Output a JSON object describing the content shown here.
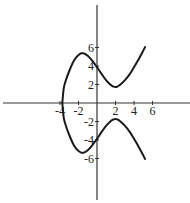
{
  "chart_data": {
    "type": "line",
    "title": "",
    "xlabel": "",
    "ylabel": "",
    "equation_approx": "y^2 = x^3 - 10x + 15",
    "xlim": [
      -10,
      10
    ],
    "ylim": [
      -10,
      10.5
    ],
    "grid": false,
    "legend": null,
    "x_ticks": [
      -4,
      -2,
      2,
      4,
      6
    ],
    "x_tick_labels": [
      "-4",
      "-2",
      "2",
      "4",
      "6"
    ],
    "y_ticks": [
      6,
      4,
      2,
      -2,
      -4,
      -6
    ],
    "y_tick_labels": [
      "6",
      "4",
      "2",
      "-2",
      "-4",
      "-6"
    ],
    "series": [
      {
        "name": "upper branch",
        "x": [
          -3.75,
          -3.6,
          -3.4,
          -3.0,
          -2.5,
          -2.0,
          -1.5,
          -1.0,
          -0.5,
          0,
          0.5,
          1.0,
          1.5,
          1.8,
          2.0,
          2.2,
          2.5,
          3.0,
          3.5,
          4.0,
          4.5,
          5.0,
          5.2
        ],
        "values": [
          0,
          1.56,
          2.35,
          3.46,
          4.57,
          5.2,
          5.39,
          5.1,
          4.55,
          3.87,
          3.13,
          2.45,
          1.94,
          1.77,
          1.73,
          1.78,
          1.98,
          2.45,
          3.07,
          3.87,
          4.72,
          5.66,
          6.05
        ]
      },
      {
        "name": "lower branch",
        "x": [
          -3.75,
          -3.6,
          -3.4,
          -3.0,
          -2.5,
          -2.0,
          -1.5,
          -1.0,
          -0.5,
          0,
          0.5,
          1.0,
          1.5,
          1.8,
          2.0,
          2.2,
          2.5,
          3.0,
          3.5,
          4.0,
          4.5,
          5.0,
          5.2
        ],
        "values": [
          0,
          -1.56,
          -2.35,
          -3.46,
          -4.57,
          -5.2,
          -5.39,
          -5.1,
          -4.55,
          -3.87,
          -3.13,
          -2.45,
          -1.94,
          -1.77,
          -1.73,
          -1.78,
          -1.98,
          -2.45,
          -3.07,
          -3.87,
          -4.72,
          -5.66,
          -6.05
        ]
      }
    ]
  },
  "colors": {
    "axis": "#333333",
    "curve": "#1a1a1a",
    "background": "#ffffff"
  },
  "axes": {
    "origin_px": [
      97,
      103
    ],
    "px_per_unit": 9.25,
    "x_axis_px": [
      3,
      190
    ],
    "y_axis_px": [
      5,
      200
    ]
  }
}
